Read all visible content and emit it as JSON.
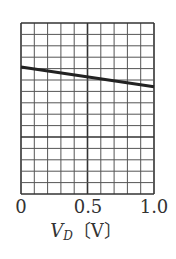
{
  "chart_data": {
    "type": "line",
    "title": "",
    "xlabel": "V_D [V]",
    "xlabel_parts": {
      "var": "V",
      "sub": "D",
      "unit": "〔V〕"
    },
    "ylabel": "",
    "xlim": [
      0,
      1.0
    ],
    "x_ticks": [
      "0",
      "0.5",
      "1.0"
    ],
    "grid": {
      "on": true,
      "columns": 10,
      "rows": 15,
      "major_vertical_at": 0.5,
      "major_horizontal_row_from_bottom": 5
    },
    "y_units": "grid rows from bottom (no y tick labels shown)",
    "ylim": [
      0,
      15
    ],
    "series": [
      {
        "name": "characteristic",
        "x": [
          0,
          1.0
        ],
        "y": [
          11.15,
          9.4
        ],
        "color": "#222222"
      }
    ]
  },
  "colors": {
    "grid": "#555555",
    "line": "#222222",
    "text": "#333333"
  }
}
